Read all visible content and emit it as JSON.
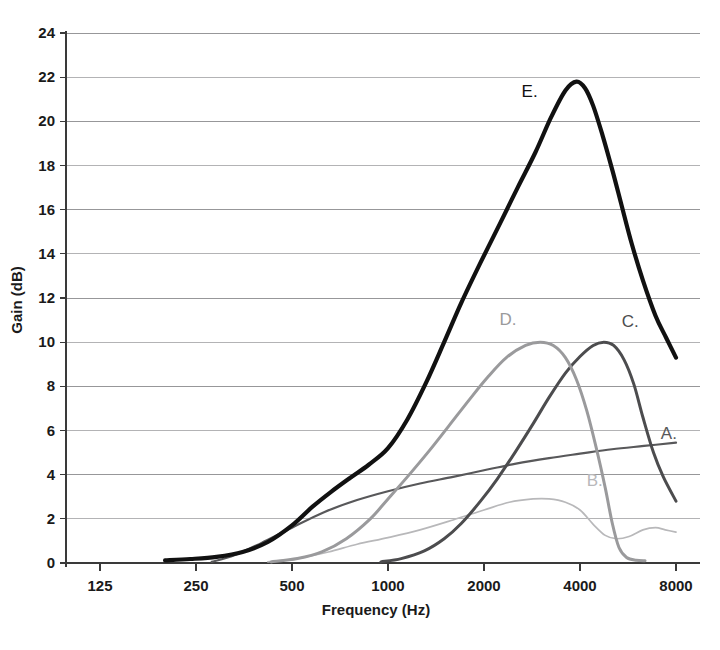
{
  "chart_data": {
    "type": "line",
    "title": "",
    "xlabel": "Frequency (Hz)",
    "ylabel": "Gain (dB)",
    "xscale": "log",
    "xlim": [
      125,
      8000
    ],
    "ylim": [
      0,
      24
    ],
    "xticks": [
      125,
      250,
      500,
      1000,
      2000,
      4000,
      8000
    ],
    "xtick_labels": [
      "125",
      "250",
      "500",
      "1000",
      "2000",
      "4000",
      "8000"
    ],
    "yticks": [
      0,
      2,
      4,
      6,
      8,
      10,
      12,
      14,
      16,
      18,
      20,
      22,
      24
    ],
    "ytick_labels": [
      "0",
      "2",
      "4",
      "6",
      "8",
      "10",
      "12",
      "14",
      "16",
      "18",
      "20",
      "22",
      "24"
    ],
    "grid": true,
    "grid_axis": "y",
    "legend": "inline-labels",
    "series": [
      {
        "name": "A.",
        "label": "A.",
        "color": "#58585a",
        "width": 2.2,
        "label_x": 7600,
        "label_y": 5.6,
        "points": [
          [
            280,
            0.05
          ],
          [
            330,
            0.35
          ],
          [
            400,
            0.9
          ],
          [
            500,
            1.6
          ],
          [
            630,
            2.3
          ],
          [
            800,
            2.85
          ],
          [
            1000,
            3.25
          ],
          [
            1260,
            3.6
          ],
          [
            1600,
            3.9
          ],
          [
            2000,
            4.2
          ],
          [
            2520,
            4.5
          ],
          [
            3200,
            4.75
          ],
          [
            4000,
            4.95
          ],
          [
            5040,
            5.15
          ],
          [
            6350,
            5.3
          ],
          [
            8000,
            5.45
          ]
        ]
      },
      {
        "name": "B.",
        "label": "B.",
        "color": "#b8b8ba",
        "width": 1.7,
        "label_x": 4450,
        "label_y": 3.5,
        "points": [
          [
            420,
            0.05
          ],
          [
            520,
            0.2
          ],
          [
            650,
            0.5
          ],
          [
            800,
            0.85
          ],
          [
            1000,
            1.15
          ],
          [
            1260,
            1.5
          ],
          [
            1600,
            1.95
          ],
          [
            2000,
            2.4
          ],
          [
            2400,
            2.75
          ],
          [
            2850,
            2.9
          ],
          [
            3200,
            2.9
          ],
          [
            3600,
            2.75
          ],
          [
            4000,
            2.4
          ],
          [
            4400,
            1.75
          ],
          [
            4800,
            1.25
          ],
          [
            5200,
            1.1
          ],
          [
            5700,
            1.2
          ],
          [
            6300,
            1.5
          ],
          [
            6900,
            1.6
          ],
          [
            7400,
            1.5
          ],
          [
            8000,
            1.4
          ]
        ]
      },
      {
        "name": "C.",
        "label": "C.",
        "color": "#4c4c4e",
        "width": 3.0,
        "label_x": 5750,
        "label_y": 10.7,
        "points": [
          [
            950,
            0.05
          ],
          [
            1100,
            0.2
          ],
          [
            1300,
            0.55
          ],
          [
            1500,
            1.1
          ],
          [
            1700,
            1.8
          ],
          [
            1950,
            2.8
          ],
          [
            2200,
            3.8
          ],
          [
            2500,
            5.0
          ],
          [
            2850,
            6.3
          ],
          [
            3200,
            7.5
          ],
          [
            3600,
            8.6
          ],
          [
            4000,
            9.35
          ],
          [
            4400,
            9.85
          ],
          [
            4750,
            10.0
          ],
          [
            5100,
            9.85
          ],
          [
            5500,
            9.2
          ],
          [
            5900,
            8.1
          ],
          [
            6300,
            6.6
          ],
          [
            6800,
            5.0
          ],
          [
            7300,
            3.9
          ],
          [
            8000,
            2.8
          ]
        ]
      },
      {
        "name": "D.",
        "label": "D.",
        "color": "#9a9a9c",
        "width": 3.0,
        "label_x": 2380,
        "label_y": 10.8,
        "points": [
          [
            430,
            0.05
          ],
          [
            520,
            0.2
          ],
          [
            620,
            0.5
          ],
          [
            740,
            1.1
          ],
          [
            880,
            2.0
          ],
          [
            1000,
            2.9
          ],
          [
            1150,
            3.9
          ],
          [
            1350,
            5.1
          ],
          [
            1550,
            6.2
          ],
          [
            1800,
            7.4
          ],
          [
            2050,
            8.4
          ],
          [
            2350,
            9.3
          ],
          [
            2700,
            9.85
          ],
          [
            3000,
            10.0
          ],
          [
            3300,
            9.85
          ],
          [
            3600,
            9.3
          ],
          [
            3900,
            8.3
          ],
          [
            4200,
            6.9
          ],
          [
            4500,
            5.2
          ],
          [
            4800,
            3.4
          ],
          [
            5050,
            1.8
          ],
          [
            5300,
            0.7
          ],
          [
            5600,
            0.25
          ],
          [
            6000,
            0.12
          ],
          [
            6400,
            0.1
          ]
        ]
      },
      {
        "name": "E.",
        "label": "E.",
        "color": "#111111",
        "width": 4.2,
        "label_x": 2780,
        "label_y": 21.1,
        "points": [
          [
            200,
            0.12
          ],
          [
            240,
            0.18
          ],
          [
            290,
            0.28
          ],
          [
            350,
            0.5
          ],
          [
            420,
            0.95
          ],
          [
            500,
            1.7
          ],
          [
            580,
            2.55
          ],
          [
            660,
            3.2
          ],
          [
            760,
            3.85
          ],
          [
            870,
            4.45
          ],
          [
            1000,
            5.2
          ],
          [
            1150,
            6.5
          ],
          [
            1320,
            8.2
          ],
          [
            1500,
            10.0
          ],
          [
            1700,
            11.8
          ],
          [
            1950,
            13.6
          ],
          [
            2250,
            15.4
          ],
          [
            2550,
            17.0
          ],
          [
            2900,
            18.6
          ],
          [
            3250,
            20.2
          ],
          [
            3600,
            21.4
          ],
          [
            3900,
            21.8
          ],
          [
            4150,
            21.5
          ],
          [
            4400,
            20.7
          ],
          [
            4700,
            19.4
          ],
          [
            5050,
            17.8
          ],
          [
            5400,
            16.2
          ],
          [
            5800,
            14.5
          ],
          [
            6300,
            12.8
          ],
          [
            6900,
            11.2
          ],
          [
            7450,
            10.2
          ],
          [
            8000,
            9.3
          ]
        ]
      }
    ]
  },
  "axes": {
    "y_title": "Gain (dB)",
    "x_title": "Frequency (Hz)"
  },
  "style": {
    "grid_color": "#8c8c8e",
    "axis_color": "#3a3a3a",
    "background": "#ffffff"
  }
}
